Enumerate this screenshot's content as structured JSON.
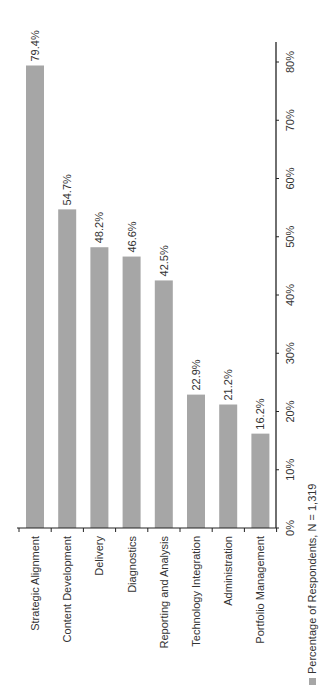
{
  "chart_data": {
    "type": "bar",
    "orientation": "vertical-bars, rotated layout (text rotated -90°)",
    "title": "",
    "xlabel": "",
    "ylabel": "",
    "categories": [
      "Strategic Alignment",
      "Content Development",
      "Delivery",
      "Diagnostics",
      "Reporting and Analysis",
      "Technology Integration",
      "Administration",
      "Portfolio Management"
    ],
    "series": [
      {
        "name": "Percentage of Respondents, N = 1,319",
        "values": [
          79.4,
          54.7,
          48.2,
          46.6,
          42.5,
          22.9,
          21.2,
          16.2
        ],
        "data_labels": [
          "79.4%",
          "54.7%",
          "48.2%",
          "46.6%",
          "42.5%",
          "22.9%",
          "21.2%",
          "16.2%"
        ]
      }
    ],
    "ylim": [
      0,
      80
    ],
    "yticks": [
      0,
      10,
      20,
      30,
      40,
      50,
      60,
      70,
      80
    ],
    "ytick_labels": [
      "0%",
      "10%",
      "20%",
      "30%",
      "40%",
      "50%",
      "60%",
      "70%",
      "80%"
    ],
    "grid": false,
    "legend": {
      "entries": [
        "Percentage of Respondents, N = 1,319"
      ],
      "placement": "bottom"
    },
    "colors": {
      "bar": "#a6a6a6",
      "axis": "#222222",
      "text": "#333333"
    }
  }
}
